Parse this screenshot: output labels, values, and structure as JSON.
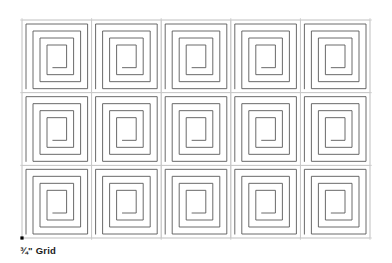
{
  "document": {
    "title": "Greek Key Spiral Grid Pattern Sheet",
    "background_color": "#ffffff"
  },
  "caption": {
    "text": "¾\" Grid",
    "color": "#1a1a1a",
    "bold": true
  },
  "pattern": {
    "name": "square-spiral-meander",
    "description": "Repeating square spiral (Greek key / labyrinth) motif",
    "columns": 5,
    "rows": 3,
    "tile_count": 15,
    "stroke_color": "#595959",
    "stroke_width": 0.9,
    "spiral_turns": 4,
    "center_opening_direction": "right",
    "area": {
      "x": 22,
      "y": 20,
      "width": 348,
      "height": 218,
      "tile_width": 69.6,
      "tile_height": 72.667
    }
  },
  "guides": {
    "grid_line_color": "#c8c8c8",
    "grid_line_width": 0.7,
    "horizontal_lines_y": [
      20,
      92.667,
      165.333,
      238
    ],
    "vertical_lines_x": [
      22,
      91.6,
      161.2,
      230.8,
      300.4,
      370
    ],
    "anchor_dot": {
      "name": "origin-anchor-dot",
      "x": 22,
      "y": 238,
      "size": 3.2,
      "color": "#000000"
    }
  }
}
